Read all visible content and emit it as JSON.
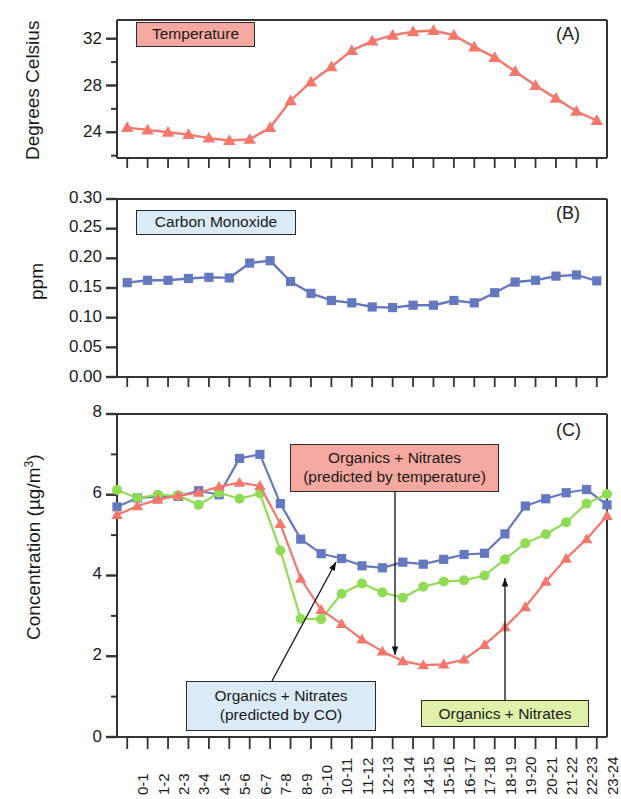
{
  "figure": {
    "panels": [
      {
        "id": "panel-a",
        "tag": "(A)",
        "ylabel": "Degrees Celsius",
        "yticks_labeled": [
          "24",
          "28",
          "32"
        ],
        "legend": "Temperature"
      },
      {
        "id": "panel-b",
        "tag": "(B)",
        "ylabel": "ppm",
        "yticks_labeled": [
          "0.00",
          "0.05",
          "0.10",
          "0.15",
          "0.20",
          "0.25",
          "0.30"
        ],
        "legend": "Carbon Monoxide"
      },
      {
        "id": "panel-c",
        "tag": "(C)",
        "ylabel": "Concentration (µg/m",
        "ylabel_sup": "3",
        "ylabel_tail": ")",
        "yticks_labeled": [
          "0",
          "2",
          "4",
          "6",
          "8"
        ],
        "legends": [
          {
            "name": "legend-predicted-temperature",
            "line1": "Organics + Nitrates",
            "line2": "(predicted by temperature)",
            "color": "#f5a8a0"
          },
          {
            "name": "legend-predicted-co",
            "line1": "Organics + Nitrates",
            "line2": "(predicted by CO)",
            "color": "#dbeaf7"
          },
          {
            "name": "legend-organics-nitrates",
            "line1": "Organics + Nitrates",
            "line2": "",
            "color": "#dff0a8"
          }
        ]
      }
    ],
    "xticklabels": [
      "0-1",
      "1-2",
      "2-3",
      "3-4",
      "4-5",
      "5-6",
      "6-7",
      "7-8",
      "8-9",
      "9-10",
      "10-11",
      "11-12",
      "12-13",
      "13-14",
      "14-15",
      "15-16",
      "16-17",
      "17-18",
      "18-19",
      "19-20",
      "20-21",
      "21-22",
      "22-23",
      "23-24"
    ],
    "colors": {
      "red": "#f4776b",
      "blue": "#6478c0",
      "green": "#8fdc54",
      "axis": "#333333"
    }
  },
  "chart_data": [
    {
      "type": "line",
      "panel": "A",
      "title": "Temperature",
      "xlabel": "",
      "ylabel": "Degrees Celsius",
      "x": [
        "0-1",
        "1-2",
        "2-3",
        "3-4",
        "4-5",
        "5-6",
        "6-7",
        "7-8",
        "8-9",
        "9-10",
        "10-11",
        "11-12",
        "12-13",
        "13-14",
        "14-15",
        "15-16",
        "16-17",
        "17-18",
        "18-19",
        "19-20",
        "20-21",
        "21-22",
        "22-23",
        "23-24"
      ],
      "ylim": [
        21.8,
        33.6
      ],
      "yticks": [
        24,
        28,
        32
      ],
      "grid": false,
      "marker": "triangle",
      "series": [
        {
          "name": "Temperature",
          "color": "#f4776b",
          "values": [
            24.4,
            24.2,
            24.0,
            23.8,
            23.5,
            23.3,
            23.4,
            24.4,
            26.7,
            28.3,
            29.6,
            31.0,
            31.8,
            32.3,
            32.6,
            32.7,
            32.3,
            31.3,
            30.4,
            29.2,
            28.0,
            26.9,
            25.8,
            25.0
          ]
        }
      ]
    },
    {
      "type": "line",
      "panel": "B",
      "title": "Carbon Monoxide",
      "xlabel": "",
      "ylabel": "ppm",
      "x": [
        "0-1",
        "1-2",
        "2-3",
        "3-4",
        "4-5",
        "5-6",
        "6-7",
        "7-8",
        "8-9",
        "9-10",
        "10-11",
        "11-12",
        "12-13",
        "13-14",
        "14-15",
        "15-16",
        "16-17",
        "17-18",
        "18-19",
        "19-20",
        "20-21",
        "21-22",
        "22-23",
        "23-24"
      ],
      "ylim": [
        0.0,
        0.3
      ],
      "yticks": [
        0.0,
        0.05,
        0.1,
        0.15,
        0.2,
        0.25,
        0.3
      ],
      "grid": false,
      "marker": "square",
      "series": [
        {
          "name": "Carbon Monoxide",
          "color": "#6478c0",
          "values": [
            0.159,
            0.163,
            0.163,
            0.166,
            0.168,
            0.167,
            0.192,
            0.196,
            0.161,
            0.141,
            0.129,
            0.125,
            0.118,
            0.117,
            0.121,
            0.121,
            0.129,
            0.125,
            0.142,
            0.16,
            0.163,
            0.17,
            0.172,
            0.162
          ]
        }
      ]
    },
    {
      "type": "line",
      "panel": "C",
      "title": "",
      "xlabel": "",
      "ylabel": "Concentration (ug/m3)",
      "x": [
        "0-1",
        "1-2",
        "2-3",
        "3-4",
        "4-5",
        "5-6",
        "6-7",
        "7-8",
        "8-9",
        "9-10",
        "10-11",
        "11-12",
        "12-13",
        "13-14",
        "14-15",
        "15-16",
        "16-17",
        "17-18",
        "18-19",
        "19-20",
        "20-21",
        "21-22",
        "22-23",
        "23-24"
      ],
      "ylim": [
        0,
        8
      ],
      "yticks": [
        0,
        2,
        4,
        6,
        8
      ],
      "grid": false,
      "series": [
        {
          "name": "Organics + Nitrates (predicted by CO)",
          "color": "#6478c0",
          "marker": "square",
          "values": [
            5.7,
            5.92,
            5.95,
            5.96,
            6.1,
            6.0,
            6.9,
            7.0,
            5.78,
            4.9,
            4.54,
            4.42,
            4.24,
            4.19,
            4.33,
            4.28,
            4.4,
            4.52,
            4.55,
            5.03,
            5.72,
            5.9,
            6.05,
            6.13,
            5.75
          ]
        },
        {
          "name": "Organics + Nitrates",
          "color": "#8fdc54",
          "marker": "circle",
          "values": [
            6.12,
            5.92,
            6.0,
            5.98,
            5.75,
            6.05,
            5.9,
            6.03,
            4.62,
            2.93,
            2.92,
            3.55,
            3.8,
            3.58,
            3.45,
            3.72,
            3.85,
            3.88,
            4.0,
            4.4,
            4.8,
            5.02,
            5.32,
            5.78,
            6.02
          ]
        },
        {
          "name": "Organics + Nitrates (predicted by temperature)",
          "color": "#f4776b",
          "marker": "triangle",
          "values": [
            5.5,
            5.72,
            5.88,
            5.98,
            6.05,
            6.2,
            6.3,
            6.22,
            5.28,
            3.92,
            3.15,
            2.8,
            2.42,
            2.12,
            1.88,
            1.78,
            1.8,
            1.92,
            2.28,
            2.72,
            3.22,
            3.85,
            4.42,
            4.9,
            5.48
          ]
        }
      ]
    }
  ]
}
